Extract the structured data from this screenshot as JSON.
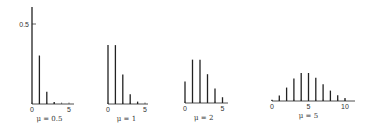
{
  "chart_data": [
    {
      "type": "bar",
      "title": "",
      "caption": "μ = 0.5",
      "xlabel": "",
      "ylabel": "",
      "x": [
        0,
        1,
        2,
        3
      ],
      "values": [
        0.607,
        0.303,
        0.076,
        0.013
      ],
      "xticks": [
        "0",
        "5"
      ],
      "yticks": [
        "0.5"
      ],
      "xlim": [
        0,
        5
      ],
      "ylim": [
        0,
        0.62
      ],
      "grid": false
    },
    {
      "type": "bar",
      "caption": "μ = 1",
      "x": [
        0,
        1,
        2,
        3,
        4
      ],
      "values": [
        0.368,
        0.368,
        0.184,
        0.061,
        0.015
      ],
      "xticks": [
        "0",
        "5"
      ],
      "xlim": [
        0,
        5
      ],
      "grid": false
    },
    {
      "type": "bar",
      "caption": "μ = 2",
      "x": [
        0,
        1,
        2,
        3,
        4,
        5
      ],
      "values": [
        0.135,
        0.271,
        0.271,
        0.18,
        0.09,
        0.036
      ],
      "xticks": [
        "0",
        "5"
      ],
      "xlim": [
        0,
        5
      ],
      "grid": false
    },
    {
      "type": "bar",
      "caption": "μ = 5",
      "x": [
        0,
        1,
        2,
        3,
        4,
        5,
        6,
        7,
        8,
        9,
        10
      ],
      "values": [
        0.007,
        0.034,
        0.084,
        0.14,
        0.175,
        0.175,
        0.146,
        0.104,
        0.065,
        0.036,
        0.018
      ],
      "xticks": [
        "0",
        "5",
        "10"
      ],
      "xlim": [
        0,
        10
      ],
      "grid": false
    }
  ],
  "layout": {
    "y_scale_px_per_unit": 160,
    "panels": [
      {
        "x0": 32,
        "baseline": 104,
        "step": 7.4,
        "axis_end": 74,
        "ytop": 7
      },
      {
        "x0": 108,
        "baseline": 104,
        "step": 7.4,
        "axis_end": 148
      },
      {
        "x0": 185,
        "baseline": 103,
        "step": 7.5,
        "axis_end": 228
      },
      {
        "x0": 272,
        "baseline": 101,
        "step": 7.3,
        "axis_end": 355
      }
    ],
    "bar_color": "#222222"
  }
}
